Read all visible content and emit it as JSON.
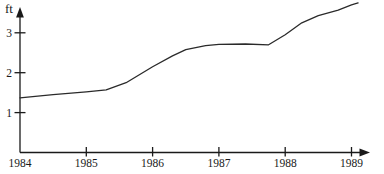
{
  "figure": {
    "background": "#ffffff"
  },
  "chart_data": {
    "type": "line",
    "title": "",
    "xlabel": "",
    "ylabel": "ft",
    "grid": false,
    "legend": "none",
    "axis_color": "#1a1a1a",
    "line_color": "#2a2a2a",
    "xlim": [
      1984,
      1989.4
    ],
    "ylim": [
      0,
      3.8
    ],
    "x_ticks": [
      1984,
      1985,
      1986,
      1987,
      1988,
      1989
    ],
    "y_ticks": [
      1,
      2,
      3
    ],
    "series": [
      {
        "name": "height-ft",
        "x": [
          1984,
          1984.5,
          1985,
          1985.3,
          1985.6,
          1986,
          1986.3,
          1986.5,
          1986.8,
          1987,
          1987.4,
          1987.75,
          1988,
          1988.25,
          1988.5,
          1988.8,
          1989,
          1989.1
        ],
        "y": [
          1.37,
          1.45,
          1.52,
          1.57,
          1.75,
          2.15,
          2.42,
          2.58,
          2.68,
          2.71,
          2.72,
          2.7,
          2.95,
          3.25,
          3.43,
          3.57,
          3.7,
          3.75
        ]
      }
    ]
  }
}
